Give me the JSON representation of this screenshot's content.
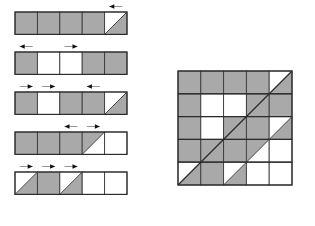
{
  "figure": {
    "title": "",
    "colors": {
      "shaded": "#a9a9a9",
      "empty": "#ffffff",
      "cell_border": "#3a3a3a",
      "outline": "#2b2b2b",
      "arrow_head": "#111111",
      "arrow_shaft": "#7a7a7a",
      "background": "#ffffff"
    },
    "legend": {
      "shaded_label": "shaded cell",
      "empty_label": "empty cell",
      "half_label": "half-shaded cell (diagonal)",
      "arrow_label": "shift arrow"
    }
  },
  "chart_data": {
    "type": "table",
    "xlabel": "column",
    "ylabel": "row",
    "grid_columns": 5,
    "grid_rows": 5,
    "cell_codes": {
      "G": "gray",
      "W": "white",
      "D1": "diagonal white upper-left / gray lower-right",
      "D2": "diagonal gray upper-left / white lower-right"
    },
    "strips": [
      {
        "index": 1,
        "name": "strip-1",
        "cells": [
          "G",
          "G",
          "G",
          "G",
          "D1"
        ],
        "arrows": [
          {
            "cell": 5,
            "direction": "left"
          }
        ]
      },
      {
        "index": 2,
        "name": "strip-2",
        "cells": [
          "G",
          "W",
          "W",
          "G",
          "G"
        ],
        "arrows": [
          {
            "cell": 1,
            "direction": "left"
          },
          {
            "cell": 3,
            "direction": "right"
          }
        ]
      },
      {
        "index": 3,
        "name": "strip-3",
        "cells": [
          "G",
          "W",
          "G",
          "G",
          "D1"
        ],
        "arrows": [
          {
            "cell": 1,
            "direction": "right"
          },
          {
            "cell": 2,
            "direction": "right"
          },
          {
            "cell": 4,
            "direction": "left"
          }
        ]
      },
      {
        "index": 4,
        "name": "strip-4",
        "cells": [
          "G",
          "G",
          "G",
          "D2",
          "W"
        ],
        "arrows": [
          {
            "cell": 3,
            "direction": "left"
          },
          {
            "cell": 4,
            "direction": "right"
          }
        ]
      },
      {
        "index": 5,
        "name": "strip-5",
        "cells": [
          "D1",
          "G",
          "D1",
          "W",
          "W"
        ],
        "arrows": [
          {
            "cell": 1,
            "direction": "right"
          },
          {
            "cell": 2,
            "direction": "right"
          },
          {
            "cell": 3,
            "direction": "right"
          }
        ]
      }
    ],
    "square": {
      "name": "assembled-square",
      "rows": [
        [
          "G",
          "G",
          "G",
          "G",
          "D1"
        ],
        [
          "G",
          "W",
          "W",
          "G",
          "G"
        ],
        [
          "G",
          "W",
          "G",
          "G",
          "D1"
        ],
        [
          "G",
          "G",
          "G",
          "D2",
          "W"
        ],
        [
          "D1",
          "G",
          "D1",
          "W",
          "W"
        ]
      ]
    }
  }
}
